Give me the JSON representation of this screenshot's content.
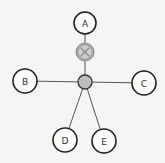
{
  "diagram": {
    "type": "star-network",
    "nodes": [
      {
        "id": "A",
        "label": "A",
        "kind": "endpoint"
      },
      {
        "id": "B",
        "label": "B",
        "kind": "endpoint"
      },
      {
        "id": "C",
        "label": "C",
        "kind": "endpoint"
      },
      {
        "id": "D",
        "label": "D",
        "kind": "endpoint"
      },
      {
        "id": "E",
        "label": "E",
        "kind": "endpoint"
      },
      {
        "id": "switch",
        "label": "",
        "kind": "valve-icon"
      },
      {
        "id": "hub",
        "label": "",
        "kind": "hub"
      }
    ],
    "edges": [
      {
        "from": "A",
        "to": "switch"
      },
      {
        "from": "switch",
        "to": "hub"
      },
      {
        "from": "B",
        "to": "hub"
      },
      {
        "from": "C",
        "to": "hub"
      },
      {
        "from": "D",
        "to": "hub"
      },
      {
        "from": "E",
        "to": "hub"
      }
    ],
    "colors": {
      "node_stroke": "#222222",
      "hub_fill": "#bdbdbd",
      "switch_fill": "#a7a7a7",
      "edge": "#555555"
    }
  }
}
